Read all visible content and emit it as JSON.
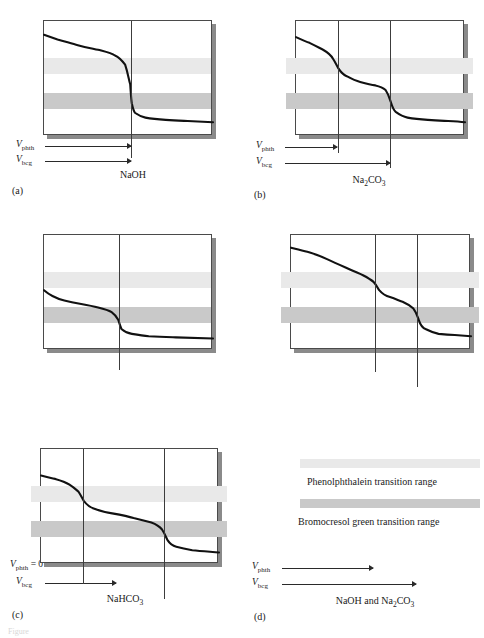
{
  "figure": {
    "caption_partial": "Figure"
  },
  "chart_data": {
    "type": "line",
    "xlabel": "Volume of titrant",
    "ylabel": "pH",
    "grid": false,
    "legend_position": "bottom-right",
    "indicator_bands": [
      {
        "name": "Phenolphthalein transition range",
        "key": "phth",
        "color": "#e9e9e9",
        "y_top_pct": 33,
        "y_bottom_pct": 47
      },
      {
        "name": "Bromocresol green transition range",
        "key": "bcg",
        "color": "#c9c9c9",
        "y_top_pct": 64,
        "y_bottom_pct": 78
      }
    ],
    "panels": [
      {
        "letter": "(a)",
        "species": "NaOH",
        "species_html": "NaOH",
        "vphth_label": "V",
        "vphth_sub": "phth",
        "vbcg_label": "V",
        "vbcg_sub": "bcg",
        "vphth_equals_zero": false,
        "equivalence_points_pct": [
          52
        ],
        "vphth_x_pct": 52,
        "vbcg_x_pct": 52,
        "curve_points": [
          [
            0,
            12
          ],
          [
            8,
            16
          ],
          [
            20,
            21
          ],
          [
            32,
            25
          ],
          [
            42,
            30
          ],
          [
            48,
            38
          ],
          [
            51,
            55
          ],
          [
            52,
            72
          ],
          [
            54,
            80
          ],
          [
            60,
            84
          ],
          [
            72,
            86
          ],
          [
            85,
            87
          ],
          [
            100,
            88
          ]
        ]
      },
      {
        "letter": "(b)",
        "species": "Na2CO3",
        "species_html": "Na<sub>2</sub>CO<sub>3</sub>",
        "vphth_label": "V",
        "vphth_sub": "phth",
        "vbcg_label": "V",
        "vbcg_sub": "bcg",
        "vphth_equals_zero": false,
        "equivalence_points_pct": [
          25,
          56
        ],
        "vphth_x_pct": 25,
        "vbcg_x_pct": 56,
        "curve_points": [
          [
            0,
            14
          ],
          [
            8,
            19
          ],
          [
            16,
            25
          ],
          [
            22,
            33
          ],
          [
            25,
            41
          ],
          [
            30,
            48
          ],
          [
            38,
            53
          ],
          [
            47,
            56
          ],
          [
            53,
            60
          ],
          [
            56,
            70
          ],
          [
            59,
            79
          ],
          [
            66,
            84
          ],
          [
            78,
            86
          ],
          [
            90,
            87
          ],
          [
            100,
            88
          ]
        ]
      },
      {
        "letter": "(c)",
        "species": "NaHCO3",
        "species_html": "NaHCO<sub>3</sub>",
        "vphth_label": "V",
        "vphth_sub": "phth",
        "vphth_suffix": " = 0",
        "vbcg_label": "V",
        "vbcg_sub": "bcg",
        "vphth_equals_zero": true,
        "equivalence_points_pct": [
          45
        ],
        "vphth_x_pct": 0,
        "vbcg_x_pct": 45,
        "curve_points": [
          [
            0,
            48
          ],
          [
            5,
            53
          ],
          [
            12,
            57
          ],
          [
            22,
            60
          ],
          [
            32,
            63
          ],
          [
            40,
            67
          ],
          [
            44,
            74
          ],
          [
            46,
            82
          ],
          [
            52,
            86
          ],
          [
            62,
            88
          ],
          [
            78,
            89
          ],
          [
            100,
            90
          ]
        ]
      },
      {
        "letter": "(d)",
        "species": "NaOH and Na2CO3",
        "species_html": "NaOH and Na<sub>2</sub>CO<sub>3</sub>",
        "vphth_label": "V",
        "vphth_sub": "phth",
        "vbcg_label": "V",
        "vbcg_sub": "bcg",
        "vphth_equals_zero": false,
        "equivalence_points_pct": [
          47,
          71
        ],
        "vphth_x_pct": 47,
        "vbcg_x_pct": 71,
        "curve_points": [
          [
            0,
            11
          ],
          [
            10,
            15
          ],
          [
            20,
            21
          ],
          [
            30,
            28
          ],
          [
            40,
            35
          ],
          [
            46,
            41
          ],
          [
            49,
            48
          ],
          [
            55,
            54
          ],
          [
            62,
            58
          ],
          [
            68,
            64
          ],
          [
            71,
            74
          ],
          [
            75,
            82
          ],
          [
            82,
            86
          ],
          [
            91,
            87
          ],
          [
            100,
            88
          ]
        ]
      },
      {
        "letter": "(e)",
        "species": "NaHCO3 and Na2CO3",
        "species_html": "NaHCO<sub>3</sub> and Na<sub>2</sub>CO<sub>3</sub>",
        "vphth_label": "V",
        "vphth_sub": "phth",
        "vbcg_label": "V",
        "vbcg_sub": "bcg",
        "vphth_equals_zero": false,
        "equivalence_points_pct": [
          24,
          70
        ],
        "vphth_x_pct": 24,
        "vbcg_x_pct": 70,
        "curve_points": [
          [
            0,
            23
          ],
          [
            8,
            26
          ],
          [
            16,
            31
          ],
          [
            21,
            37
          ],
          [
            24,
            45
          ],
          [
            30,
            52
          ],
          [
            40,
            56
          ],
          [
            52,
            60
          ],
          [
            62,
            64
          ],
          [
            68,
            70
          ],
          [
            71,
            79
          ],
          [
            76,
            85
          ],
          [
            85,
            88
          ],
          [
            100,
            90
          ]
        ]
      }
    ],
    "legend": [
      {
        "label": "Phenolphthalein transition range",
        "key": "phth"
      },
      {
        "label": "Bromocresol green transition range",
        "key": "bcg"
      }
    ]
  }
}
